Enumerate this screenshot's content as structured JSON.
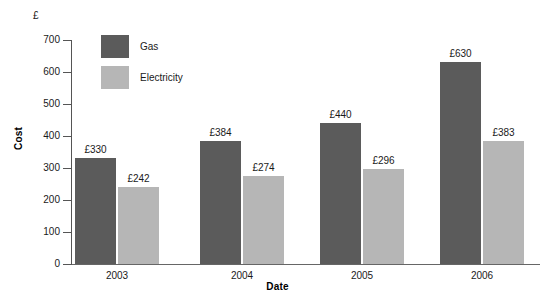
{
  "chart_data": {
    "type": "bar",
    "title": "",
    "subtitle": "",
    "unit_symbol": "£",
    "xlabel": "Date",
    "ylabel": "Cost",
    "categories": [
      "2003",
      "2004",
      "2005",
      "2006"
    ],
    "series": [
      {
        "name": "Gas",
        "color": "#5b5b5b",
        "values": [
          330,
          384,
          440,
          630
        ],
        "value_labels": [
          "£330",
          "£384",
          "£440",
          "£630"
        ]
      },
      {
        "name": "Electricity",
        "color": "#b6b6b6",
        "values": [
          242,
          274,
          296,
          383
        ],
        "value_labels": [
          "£242",
          "£274",
          "£296",
          "£383"
        ]
      }
    ],
    "ylim": [
      0,
      700
    ],
    "ytick_values": [
      0,
      100,
      200,
      300,
      400,
      500,
      600,
      700
    ],
    "ytick_labels": [
      "0",
      "100",
      "200",
      "300",
      "400",
      "500",
      "600",
      "700"
    ],
    "grid": false,
    "legend_position": "top-left-inside",
    "legend_entries": [
      "Gas",
      "Electricity"
    ]
  }
}
